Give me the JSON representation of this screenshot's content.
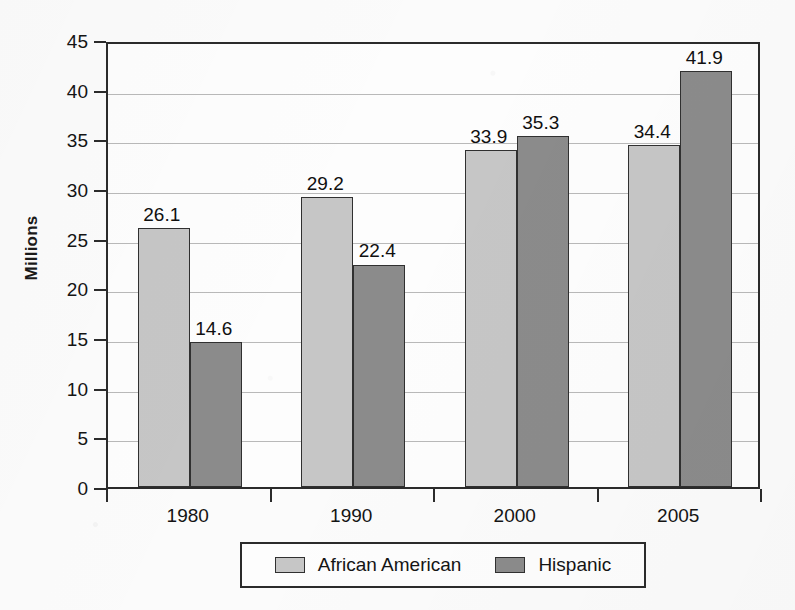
{
  "chart_data": {
    "type": "bar",
    "title": "",
    "xlabel": "",
    "ylabel": "Millions",
    "categories": [
      "1980",
      "1990",
      "2000",
      "2005"
    ],
    "series": [
      {
        "name": "African American",
        "values": [
          26.1,
          29.2,
          33.9,
          34.4
        ],
        "color": "#c6c6c6"
      },
      {
        "name": "Hispanic",
        "values": [
          14.6,
          22.4,
          35.3,
          41.9
        ],
        "color": "#8b8b8b"
      }
    ],
    "ylim": [
      0,
      45
    ],
    "ytick_step": 5,
    "yticks": [
      "0",
      "5",
      "10",
      "15",
      "20",
      "25",
      "30",
      "35",
      "40",
      "45"
    ],
    "data_labels": [
      "26.1",
      "14.6",
      "29.2",
      "22.4",
      "33.9",
      "35.3",
      "34.4",
      "41.9"
    ],
    "grid": true,
    "legend_position": "bottom",
    "legend_entries": [
      "African American",
      "Hispanic"
    ],
    "frame": true
  }
}
